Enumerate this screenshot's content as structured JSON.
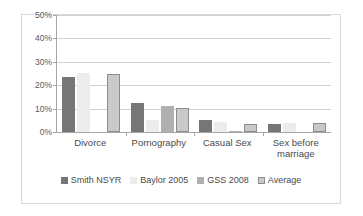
{
  "title_strip": "",
  "chart_data": {
    "type": "bar",
    "title": "",
    "subtitle": "",
    "xlabel": "",
    "ylabel": "",
    "ylim": [
      0,
      50
    ],
    "y_unit": "%",
    "grid": true,
    "legend_position": "bottom",
    "y_ticks": [
      "0%",
      "10%",
      "20%",
      "30%",
      "40%",
      "50%"
    ],
    "y_tick_values": [
      0,
      10,
      20,
      30,
      40,
      50
    ],
    "categories": [
      "Divorce",
      "Pornography",
      "Casual Sex",
      "Sex before marriage"
    ],
    "series": [
      {
        "name": "Smith NSYR",
        "color": "#767676",
        "values": [
          23.3,
          12.5,
          5.0,
          3.4
        ]
      },
      {
        "name": "Baylor 2005",
        "color": "#ececec",
        "values": [
          25.4,
          5.1,
          4.3,
          3.8
        ]
      },
      {
        "name": "GSS 2008",
        "color": "#b0b0b0",
        "values": [
          0,
          11.3,
          0.5,
          0
        ]
      },
      {
        "name": "Average",
        "color": "#c9c9c9",
        "values": [
          24.8,
          10.1,
          3.5,
          4.0
        ]
      }
    ]
  }
}
